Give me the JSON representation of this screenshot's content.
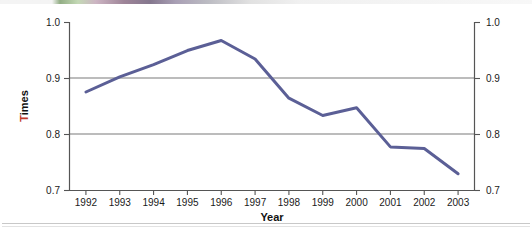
{
  "chart_data": {
    "type": "line",
    "title": "",
    "xlabel": "Year",
    "ylabel": "Times",
    "categories": [
      "1992",
      "1993",
      "1994",
      "1995",
      "1996",
      "1997",
      "1998",
      "1999",
      "2000",
      "2001",
      "2002",
      "2003"
    ],
    "x": [
      1992,
      1993,
      1994,
      1995,
      1996,
      1997,
      1998,
      1999,
      2000,
      2001,
      2002,
      2003
    ],
    "values": [
      0.875,
      0.902,
      0.924,
      0.949,
      0.967,
      0.934,
      0.864,
      0.833,
      0.847,
      0.777,
      0.774,
      0.729
    ],
    "series": [
      {
        "name": "Times",
        "color": "#5b5f96",
        "values": [
          0.875,
          0.902,
          0.924,
          0.949,
          0.967,
          0.934,
          0.864,
          0.833,
          0.847,
          0.777,
          0.774,
          0.729
        ]
      }
    ],
    "xlim": [
      1991.5,
      2003.5
    ],
    "ylim": [
      0.7,
      1.0
    ],
    "yticks": [
      0.7,
      0.8,
      0.9,
      1.0
    ],
    "ytick_labels": [
      "0.7",
      "0.8",
      "0.9",
      "1.0"
    ],
    "ytick_labels_right": [
      "0.7",
      "0.8",
      "0.9",
      "1.0"
    ],
    "xtick_labels": [
      "1992",
      "1993",
      "1994",
      "1995",
      "1996",
      "1997",
      "1998",
      "1999",
      "2000",
      "2001",
      "2002",
      "2003"
    ],
    "grid": "horizontal gridlines at 0.8 and 0.9 only",
    "gridlines": [
      0.8,
      0.9
    ],
    "legend": "none",
    "legend_position": "none",
    "dual_y_axis": true,
    "annotations": []
  },
  "axes": {
    "left_axis_name": "left-value-axis",
    "right_axis_name": "right-value-axis",
    "bottom_axis_name": "year-axis",
    "y_label_first_char": "T",
    "y_label_rest": "imes",
    "y_label_first_char_color": "#c0392b",
    "y_label_rest_color": "#111111",
    "x_title": "Year"
  },
  "colors": {
    "line": "#5b5f96",
    "axis": "#555555",
    "gridline": "#7a7a7a",
    "text": "#1a1a1a",
    "background": "#ffffff",
    "accent_red": "#c0392b"
  }
}
